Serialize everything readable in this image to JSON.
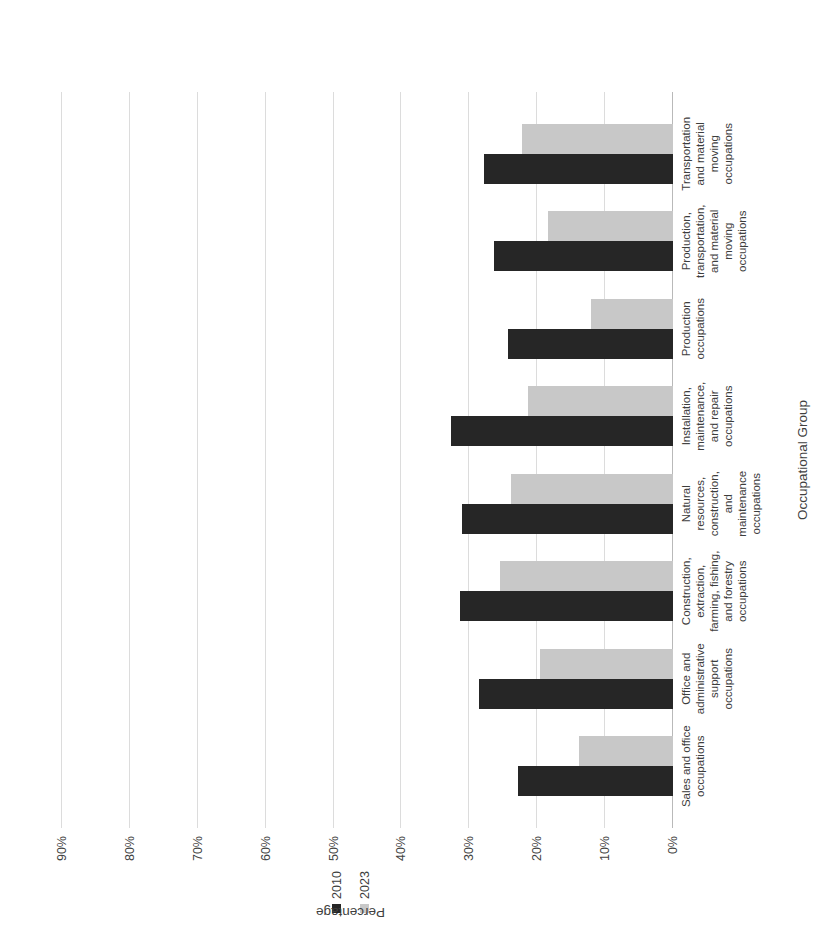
{
  "chart_data": {
    "type": "bar",
    "title": "",
    "xlabel": "Occupational Group",
    "ylabel": "Percentage",
    "ylim": [
      0,
      95
    ],
    "grid": true,
    "legend_position": "right",
    "tick_labels": [
      "0%",
      "10%",
      "20%",
      "30%",
      "40%",
      "50%",
      "60%",
      "70%",
      "80%",
      "90%"
    ],
    "tick_values": [
      0,
      10,
      20,
      30,
      40,
      50,
      60,
      70,
      80,
      90
    ],
    "categories": [
      "Sales and office occupations",
      "Office and administrative support occupations",
      "Construction, extraction, farming, fishing, and forestry occupations",
      "Natural resources, construction, and maintenance occupations",
      "Installation, maintenance, and repair occupations",
      "Production occupations",
      "Production, transportation, and material moving occupations",
      "Transportation and material moving occupations"
    ],
    "series": [
      {
        "name": "2010",
        "color": "#262626",
        "values": [
          22.8,
          28.6,
          31.4,
          31.1,
          32.7,
          24.3,
          26.3,
          27.9
        ]
      },
      {
        "name": "2023",
        "color": "#c8c8c8",
        "values": [
          13.8,
          19.6,
          25.5,
          23.9,
          21.3,
          12.1,
          18.4,
          22.3
        ]
      }
    ]
  },
  "legend": {
    "items": [
      {
        "label": "2010"
      },
      {
        "label": "2023"
      }
    ]
  },
  "axes": {
    "value_axis_title": "Percentage",
    "category_axis_title": "Occupational Group"
  }
}
